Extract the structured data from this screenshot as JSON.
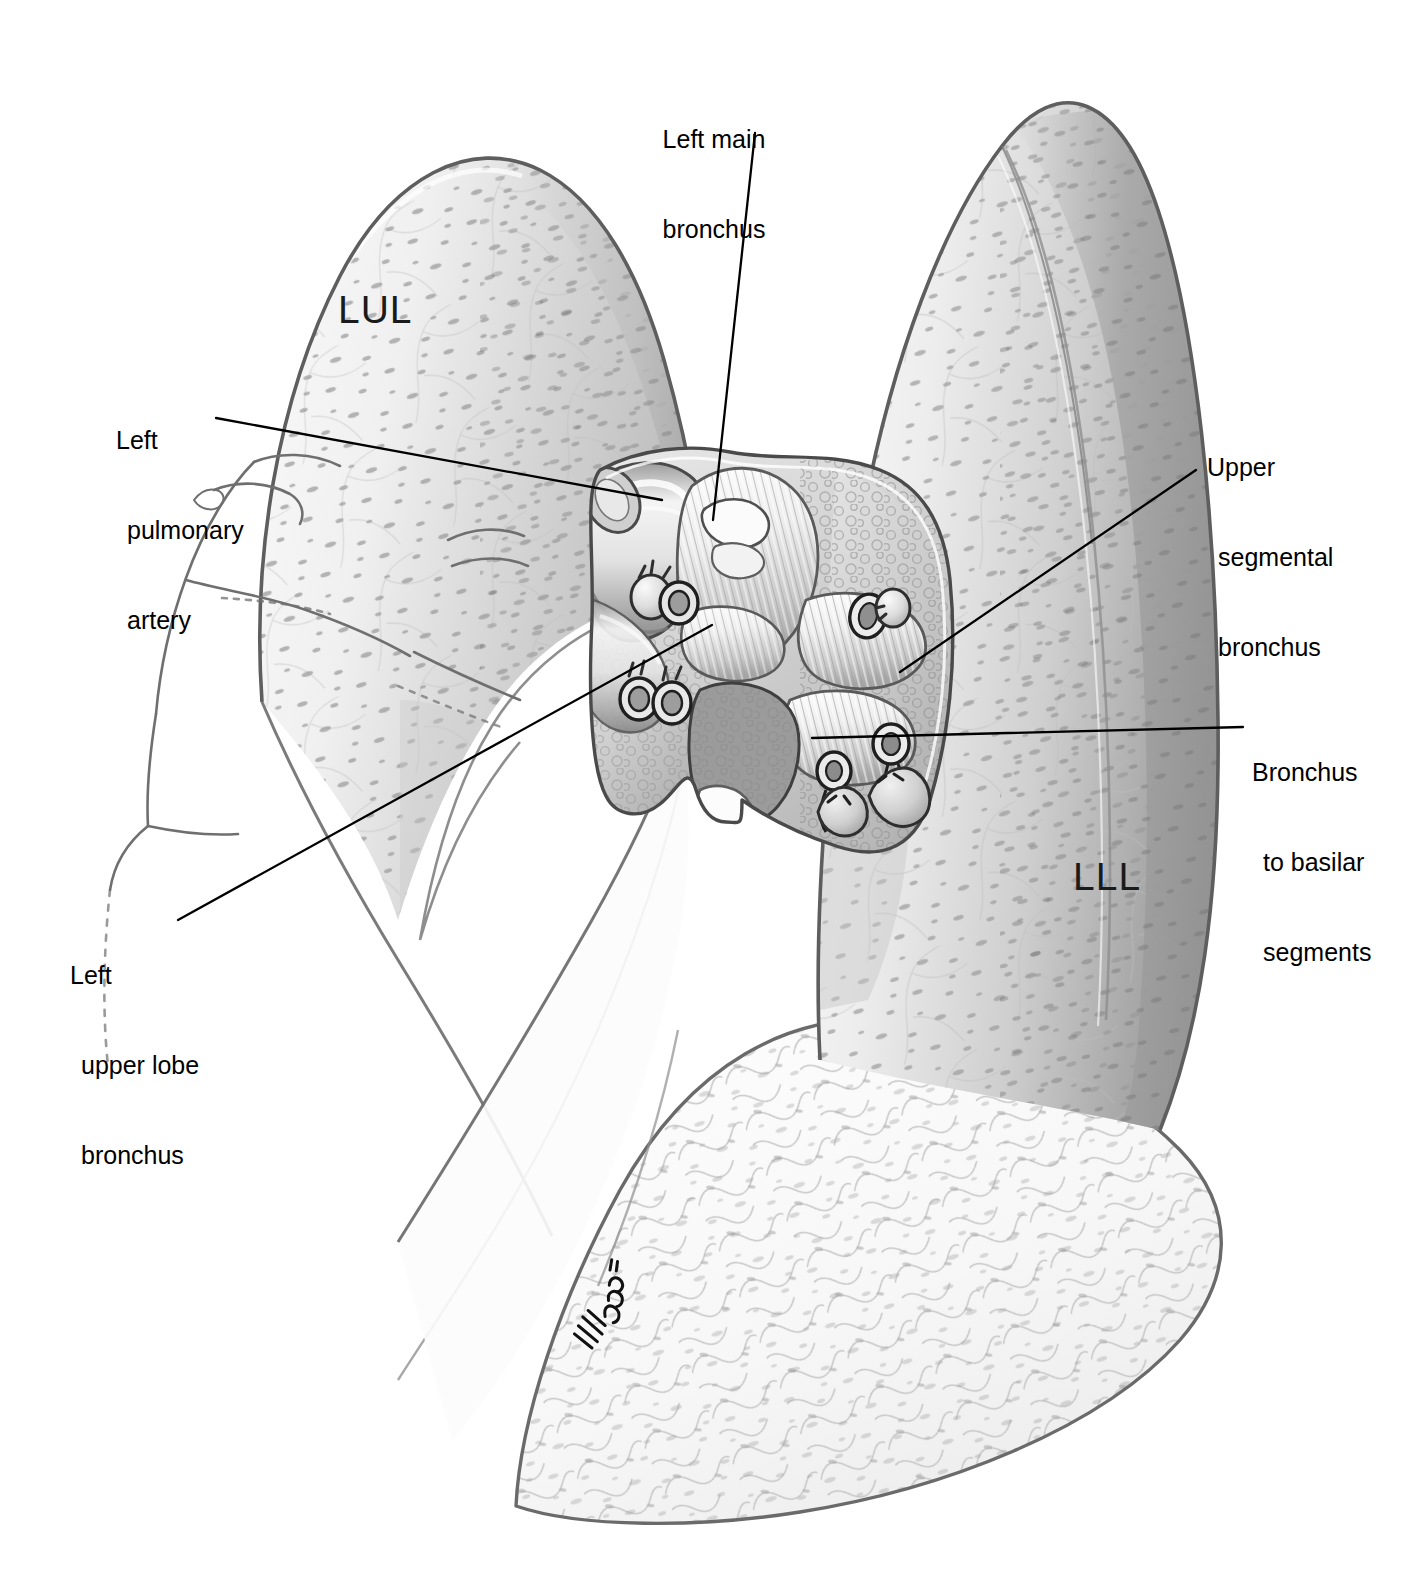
{
  "figure": {
    "background_color": "#ffffff",
    "ink_color": "#000000"
  },
  "labels": [
    {
      "id": "left-main-bronchus",
      "lines": [
        "Left main",
        "bronchus"
      ],
      "align": "center",
      "x": 722,
      "y": 68,
      "leader": {
        "x1": 755,
        "y1": 133,
        "x2": 713,
        "y2": 520
      }
    },
    {
      "id": "left-pulmonary-artery",
      "lines": [
        "Left",
        "pulmonary",
        "artery"
      ],
      "align": "left",
      "x": 116,
      "y": 365,
      "leader": {
        "x1": 216,
        "y1": 418,
        "x2": 662,
        "y2": 500
      }
    },
    {
      "id": "left-upper-lobe-bronchus",
      "lines": [
        "Left",
        "upper lobe",
        "bronchus"
      ],
      "align": "left",
      "x": 70,
      "y": 900,
      "leader": {
        "x1": 178,
        "y1": 920,
        "x2": 712,
        "y2": 625
      }
    },
    {
      "id": "upper-segmental-bronchus",
      "lines": [
        "Upper",
        "segmental",
        "bronchus"
      ],
      "align": "left",
      "x": 1207,
      "y": 392,
      "leader": {
        "x1": 1196,
        "y1": 470,
        "x2": 900,
        "y2": 672
      }
    },
    {
      "id": "bronchus-to-basilar-segments",
      "lines": [
        "Bronchus",
        "to basilar",
        "segments"
      ],
      "align": "left",
      "x": 1252,
      "y": 697,
      "leader": {
        "x1": 1243,
        "y1": 727,
        "x2": 812,
        "y2": 738
      }
    }
  ],
  "lobe_tags": [
    {
      "id": "lul",
      "text": "LUL",
      "x": 338,
      "y": 288
    },
    {
      "id": "lll",
      "text": "LLL",
      "x": 1073,
      "y": 855
    }
  ],
  "structures": {
    "upper_lobe": "Left upper lobe (LUL) retracted anteriorly",
    "lower_lobe": "Left lower lobe (LLL) retracted posteriorly",
    "hand": "Surgeon's hand retracting the upper lobe",
    "hilum": "Opened hilum with ligated vascular stumps and exposed bronchial tree",
    "signature": "Artist signature"
  },
  "colors": {
    "line": "#1a1a1a",
    "lung_light": "#f2f2f2",
    "lung_mid": "#d8d8d8",
    "lung_dark": "#b4b4b4",
    "lung_darker": "#9a9a9a",
    "tissue_mid": "#c9c9c9",
    "tissue_shadow": "#8d8d8d",
    "speck": "#9b9b9b"
  }
}
